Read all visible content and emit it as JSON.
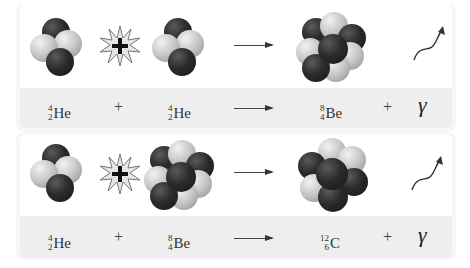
{
  "reactions": [
    {
      "id": "he-he-fusion",
      "reactants": [
        {
          "symbol": "He",
          "mass_number": "4",
          "atomic_number": "2",
          "nucleons": 4
        },
        {
          "symbol": "He",
          "mass_number": "4",
          "atomic_number": "2",
          "nucleons": 4
        }
      ],
      "products": [
        {
          "symbol": "Be",
          "mass_number": "8",
          "atomic_number": "4",
          "nucleons": 8
        },
        {
          "symbol": "γ",
          "type": "gamma-ray"
        }
      ],
      "plus": "+",
      "arrow": "→"
    },
    {
      "id": "he-be-fusion",
      "reactants": [
        {
          "symbol": "He",
          "mass_number": "4",
          "atomic_number": "2",
          "nucleons": 4
        },
        {
          "symbol": "Be",
          "mass_number": "8",
          "atomic_number": "4",
          "nucleons": 8
        }
      ],
      "products": [
        {
          "symbol": "C",
          "mass_number": "12",
          "atomic_number": "6",
          "nucleons": 12
        },
        {
          "symbol": "γ",
          "type": "gamma-ray"
        }
      ],
      "plus": "+",
      "arrow": "→"
    }
  ],
  "legend": {
    "dark_sphere": "neutron",
    "light_sphere": "proton",
    "colors": {
      "dark": "#2c2c2c",
      "light": "#c9c9c9",
      "band": "#eeeeee"
    }
  },
  "icons": {
    "collision": "starburst-plus-icon",
    "photon": "wavy-arrow-icon"
  }
}
